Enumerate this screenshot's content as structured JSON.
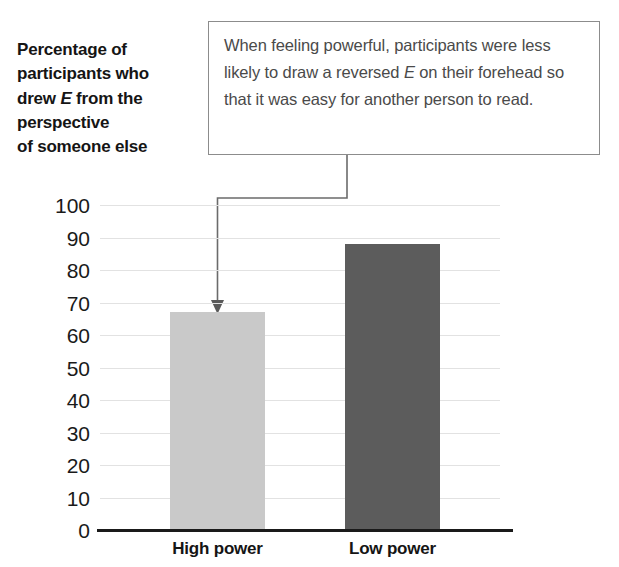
{
  "axis_title": {
    "lines": [
      {
        "text": "Percentage of"
      },
      {
        "text": "participants who"
      },
      {
        "pre": "drew ",
        "italic": "E",
        "post": " from the"
      },
      {
        "text": "perspective"
      },
      {
        "text": "of someone else"
      }
    ],
    "plain": "Percentage of participants who drew E from the perspective of someone else"
  },
  "annotation": {
    "pre": "When feeling powerful, participants were less likely to draw a reversed ",
    "italic": "E",
    "post": " on their forehead so that it was easy for another person to read.",
    "full": "When feeling powerful, participants were less likely to draw a reversed E on their forehead so that it was easy for another person to read.",
    "points_to": "High power"
  },
  "colors": {
    "bar_high_power": "#c9c9c9",
    "bar_low_power": "#5c5c5c",
    "gridline": "#e2e2e2",
    "axis": "#1a1a1a",
    "box_border": "#8c8c8c",
    "annotation_text": "#4a4a4a",
    "leader_line": "#6b6b6b"
  },
  "chart_data": {
    "type": "bar",
    "title": "Percentage of participants who drew E from the perspective of someone else",
    "xlabel": "",
    "ylabel": "Percentage of participants who drew E from the perspective of someone else",
    "categories": [
      "High power",
      "Low power"
    ],
    "values": [
      67,
      88
    ],
    "ylim": [
      0,
      100
    ],
    "yticks": [
      100,
      90,
      80,
      70,
      60,
      50,
      40,
      30,
      20,
      10,
      0
    ],
    "ytick_labels": [
      "100",
      "90",
      "80",
      "70",
      "60",
      "50",
      "40",
      "30",
      "20",
      "10",
      "0"
    ],
    "grid": true,
    "legend": false,
    "bar_colors": [
      "#c9c9c9",
      "#5c5c5c"
    ],
    "annotations": [
      {
        "text": "When feeling powerful, participants were less likely to draw a reversed E on their forehead so that it was easy for another person to read.",
        "target_category": "High power"
      }
    ]
  }
}
